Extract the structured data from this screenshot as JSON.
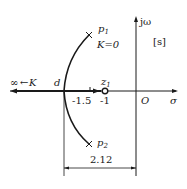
{
  "diagram": {
    "type": "root-locus",
    "plane_label": "[s]",
    "axes": {
      "real": "σ",
      "imag": "jω",
      "origin": "O"
    },
    "poles": [
      {
        "name": "p",
        "sub": "1",
        "annotation": "K=0"
      },
      {
        "name": "p",
        "sub": "2"
      }
    ],
    "zeros": [
      {
        "name": "z",
        "sub": "1",
        "value": "-1"
      }
    ],
    "breakaway": {
      "label": "d"
    },
    "ticks": {
      "t1": "-1.5",
      "t2": "-1"
    },
    "infinity_label": "∞",
    "gain_label": "K",
    "dimension": "2.12",
    "colors": {
      "line": "#1a1a1a",
      "bg": "#ffffff"
    }
  }
}
